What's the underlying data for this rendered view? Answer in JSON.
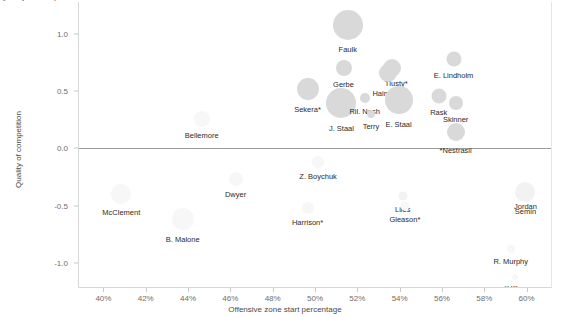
{
  "chart_data": {
    "type": "scatter",
    "title": "Quality of competition vs zone starts",
    "xlabel": "Offensive zone start percentage",
    "ylabel": "Quality of competition",
    "xlim": [
      38.8,
      61.2
    ],
    "ylim": [
      -1.22,
      1.28
    ],
    "xticks": [
      "40%",
      "42%",
      "44%",
      "46%",
      "48%",
      "50%",
      "52%",
      "54%",
      "56%",
      "58%",
      "60%"
    ],
    "xtickvals": [
      40,
      42,
      44,
      46,
      48,
      50,
      52,
      54,
      56,
      58,
      60
    ],
    "yticks": [
      "1.0",
      "0.5",
      "0.0",
      "-0.5",
      "-1.0"
    ],
    "ytickvals": [
      1.0,
      0.5,
      0.0,
      -0.5,
      -1.0
    ],
    "grid": false,
    "reference_line_y": 0.0,
    "legend": "none",
    "marker_color": "#d9d9d9",
    "points": [
      {
        "label": "Faulk",
        "x": 51.5,
        "y": 1.08,
        "size": 30,
        "shade": "solid",
        "label_dx": 0,
        "label_dy": 20
      },
      {
        "label": "Gerbe",
        "x": 51.3,
        "y": 0.7,
        "size": 16,
        "shade": "solid",
        "label_dx": 0,
        "label_dy": 12
      },
      {
        "label": "Tlusty*",
        "x": 53.6,
        "y": 0.7,
        "size": 18,
        "shade": "solid",
        "label_dx": 4,
        "label_dy": 11
      },
      {
        "label": "Hainsey",
        "x": 53.4,
        "y": 0.66,
        "size": 18,
        "shade": "solid",
        "label_dx": -2,
        "label_dy": 16
      },
      {
        "label": "E. Lindholm",
        "x": 56.5,
        "y": 0.78,
        "size": 15,
        "shade": "solid",
        "label_dx": 0,
        "label_dy": 12
      },
      {
        "label": "Sekera*",
        "x": 49.6,
        "y": 0.52,
        "size": 22,
        "shade": "solid",
        "label_dx": 0,
        "label_dy": 16
      },
      {
        "label": "J. Staal",
        "x": 51.2,
        "y": 0.4,
        "size": 30,
        "shade": "solid",
        "label_dx": 0,
        "label_dy": 21
      },
      {
        "label": "Ril. Nash",
        "x": 52.3,
        "y": 0.44,
        "size": 10,
        "shade": "solid",
        "label_dx": 0,
        "label_dy": 9
      },
      {
        "label": "E. Staal",
        "x": 53.9,
        "y": 0.42,
        "size": 28,
        "shade": "solid",
        "label_dx": 0,
        "label_dy": 20
      },
      {
        "label": "Terry",
        "x": 52.6,
        "y": 0.3,
        "size": 8,
        "shade": "solid",
        "label_dx": 0,
        "label_dy": 8
      },
      {
        "label": "Rask",
        "x": 55.8,
        "y": 0.46,
        "size": 15,
        "shade": "solid",
        "label_dx": 0,
        "label_dy": 12
      },
      {
        "label": "Skinner",
        "x": 56.6,
        "y": 0.4,
        "size": 14,
        "shade": "solid",
        "label_dx": 0,
        "label_dy": 12
      },
      {
        "label": "*Nestrasil",
        "x": 56.6,
        "y": 0.14,
        "size": 18,
        "shade": "solid",
        "label_dx": 0,
        "label_dy": 14
      },
      {
        "label": "Bellemore",
        "x": 44.6,
        "y": 0.26,
        "size": 16,
        "shade": "vfaint",
        "label_dx": 0,
        "label_dy": 12
      },
      {
        "label": "Z. Boychuk",
        "x": 50.1,
        "y": -0.12,
        "size": 12,
        "shade": "vfaint",
        "label_dx": 0,
        "label_dy": 10
      },
      {
        "label": "Dwyer",
        "x": 46.2,
        "y": -0.27,
        "size": 14,
        "shade": "vfaint",
        "label_dx": 0,
        "label_dy": 11
      },
      {
        "label": "McClement",
        "x": 40.8,
        "y": -0.4,
        "size": 20,
        "shade": "vfaint",
        "label_dx": 0,
        "label_dy": 14
      },
      {
        "label": "Harrison*",
        "x": 49.6,
        "y": -0.52,
        "size": 12,
        "shade": "vfaint",
        "label_dx": 0,
        "label_dy": 10
      },
      {
        "label": "Liles",
        "x": 54.1,
        "y": -0.42,
        "size": 9,
        "shade": "faint",
        "label_dx": 0,
        "label_dy": 9
      },
      {
        "label": "Gleason*",
        "x": 54.2,
        "y": -0.5,
        "size": 9,
        "shade": "vfaint",
        "label_dx": 0,
        "label_dy": 9
      },
      {
        "label": "B. Malone",
        "x": 43.7,
        "y": -0.62,
        "size": 22,
        "shade": "vfaint",
        "label_dx": 0,
        "label_dy": 16
      },
      {
        "label": "Semin",
        "x": 59.9,
        "y": -0.38,
        "size": 20,
        "shade": "faint",
        "label_dx": 0,
        "label_dy": 15
      },
      {
        "label": "Jordan",
        "x": 59.9,
        "y": -0.47,
        "size": 0,
        "shade": "none",
        "label_dx": 0,
        "label_dy": 0
      },
      {
        "label": "R. Murphy",
        "x": 59.2,
        "y": -0.88,
        "size": 8,
        "shade": "vfaint",
        "label_dx": 0,
        "label_dy": 8
      },
      {
        "label": "*Hillen",
        "x": 59.4,
        "y": -1.12,
        "size": 6,
        "shade": "vfaint",
        "label_dx": 0,
        "label_dy": 7
      }
    ]
  }
}
